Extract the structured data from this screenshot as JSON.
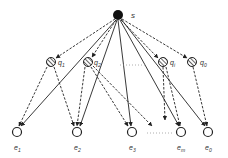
{
  "diagram": {
    "type": "bipartite-flow-graph",
    "colors": {
      "stroke": "#222222",
      "source_fill": "#111111",
      "node_fill": "#ffffff",
      "label": "#333333",
      "ellipsis": "#9a9a9a"
    },
    "source": {
      "id": "s",
      "label": "s",
      "x": 118,
      "y": 15
    },
    "middle_nodes": [
      {
        "id": "q1",
        "label": "q",
        "sub": "1",
        "x": 51,
        "y": 62
      },
      {
        "id": "q2",
        "label": "q",
        "sub": "2",
        "x": 88,
        "y": 62
      },
      {
        "id": "qi",
        "label": "q",
        "sub": "i",
        "x": 163,
        "y": 62
      },
      {
        "id": "q0",
        "label": "q",
        "sub": "0",
        "x": 192,
        "y": 62
      }
    ],
    "bottom_nodes": [
      {
        "id": "e1",
        "label": "e",
        "sub": "1",
        "x": 17,
        "y": 132
      },
      {
        "id": "e2",
        "label": "e",
        "sub": "2",
        "x": 77,
        "y": 132
      },
      {
        "id": "e3",
        "label": "e",
        "sub": "3",
        "x": 132,
        "y": 132
      },
      {
        "id": "em",
        "label": "e",
        "sub": "m",
        "x": 181,
        "y": 132
      },
      {
        "id": "e0",
        "label": "e",
        "sub": "0",
        "x": 208,
        "y": 132
      }
    ],
    "ellipses": [
      {
        "between": [
          "q2",
          "qi"
        ],
        "text": "......"
      },
      {
        "between": [
          "e3",
          "em"
        ],
        "text": "......"
      }
    ],
    "edges": {
      "source_to_middle_dashed": [
        "q1",
        "q2",
        "qi",
        "q0"
      ],
      "source_to_bottom_solid": [
        "e1",
        "e2",
        "e3",
        "em",
        "e0"
      ],
      "middle_to_bottom_dashed": [
        [
          "q1",
          "e1"
        ],
        [
          "q1",
          "e2"
        ],
        [
          "q2",
          "e2"
        ],
        [
          "q2",
          "e3"
        ],
        [
          "q2",
          "…"
        ],
        [
          "qi",
          "…"
        ],
        [
          "qi",
          "em"
        ],
        [
          "q0",
          "e0"
        ]
      ]
    }
  }
}
